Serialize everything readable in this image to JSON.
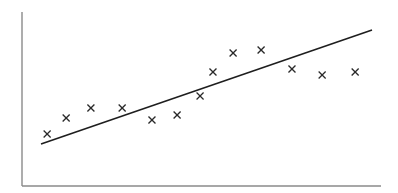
{
  "chart_data": {
    "type": "scatter",
    "title": "",
    "xlabel": "",
    "ylabel": "",
    "xlim": [
      0,
      100
    ],
    "ylim": [
      0,
      100
    ],
    "grid": false,
    "legend": null,
    "tick_labels": {
      "x": [],
      "y": []
    },
    "marker": "x",
    "series": [
      {
        "name": "observations",
        "points": [
          {
            "x": 7.0,
            "y": 29.9
          },
          {
            "x": 12.3,
            "y": 39.1
          },
          {
            "x": 19.2,
            "y": 44.8
          },
          {
            "x": 27.9,
            "y": 44.8
          },
          {
            "x": 36.2,
            "y": 37.9
          },
          {
            "x": 43.2,
            "y": 40.8
          },
          {
            "x": 49.6,
            "y": 51.7
          },
          {
            "x": 53.2,
            "y": 65.5
          },
          {
            "x": 58.8,
            "y": 76.4
          },
          {
            "x": 66.6,
            "y": 78.2
          },
          {
            "x": 75.2,
            "y": 67.2
          },
          {
            "x": 83.6,
            "y": 63.8
          },
          {
            "x": 92.8,
            "y": 65.5
          }
        ]
      }
    ],
    "fit_line": {
      "name": "linear fit",
      "start": {
        "x": 5.3,
        "y": 24.1
      },
      "end": {
        "x": 97.5,
        "y": 89.7
      }
    },
    "colors": {
      "axis": "#8a8a8a",
      "line": "#1e1e1e",
      "marker": "#2a2a2a",
      "background": "#ffffff"
    }
  }
}
